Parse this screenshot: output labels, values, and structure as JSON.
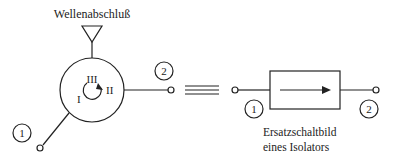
{
  "circulator": {
    "termination_label": "Wellenabschluß",
    "ports": [
      "I",
      "II",
      "III"
    ],
    "port1_label": "1",
    "port2_label": "2"
  },
  "equivalence_symbol": "≡",
  "isolator": {
    "port1_label": "1",
    "port2_label": "2",
    "caption_line1": "Ersatzschaltbild",
    "caption_line2": "eines Isolators"
  }
}
